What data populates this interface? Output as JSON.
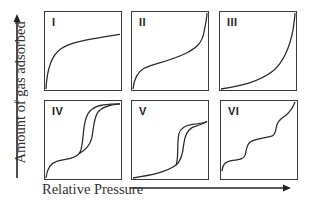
{
  "diagram": {
    "y_axis_label": "Amount of gas adsorbed",
    "x_axis_label": "Relative Pressure",
    "panels": [
      {
        "label": "I",
        "type": "Type I isotherm",
        "description": "Steep rise at low pressure then near plateau (Langmuir-like)"
      },
      {
        "label": "II",
        "type": "Type II isotherm",
        "description": "Knee at low pressure, linear middle, steep rise near saturation"
      },
      {
        "label": "III",
        "type": "Type III isotherm",
        "description": "Convex toward pressure axis, rises steeply at high pressure"
      },
      {
        "label": "IV",
        "type": "Type IV isotherm",
        "description": "Initial knee, hysteresis loop, plateau at high pressure"
      },
      {
        "label": "V",
        "type": "Type V isotherm",
        "description": "Convex start, hysteresis loop, plateau at high pressure"
      },
      {
        "label": "VI",
        "type": "Type VI isotherm",
        "description": "Stepwise multilayer adsorption"
      }
    ],
    "colors": {
      "line": "#2a2a2a",
      "border": "#3a3a3a",
      "text": "#333333",
      "background": "#ffffff"
    }
  }
}
